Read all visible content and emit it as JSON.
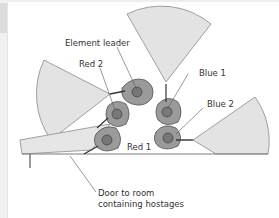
{
  "diagram": {
    "labels": {
      "element_leader": "Element leader",
      "red2": "Red 2",
      "blue1": "Blue 1",
      "blue2": "Blue 2",
      "red1": "Red 1",
      "door_line1": "Door to room",
      "door_line2": "containing hostages"
    },
    "colors": {
      "sector_fill": "#e3e3e3",
      "sector_stroke": "#8a8a8a",
      "wall_fill": "#e6e6e6",
      "figure_fill": "#9a9a9a",
      "figure_stroke": "#444444",
      "text": "#333333"
    }
  }
}
